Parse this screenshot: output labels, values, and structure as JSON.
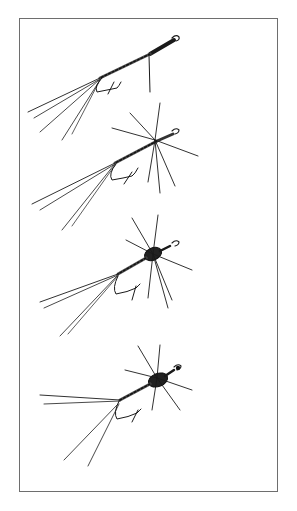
{
  "illustration": {
    "subject": "Four fly-fishing flies, pen-and-ink line drawings",
    "frame_color": "#6e6e6e",
    "ink_color": "#1a1a1a",
    "flies": [
      {
        "name": "fly-1",
        "style": "spinner with sparse hackle, long split tails"
      },
      {
        "name": "fly-2",
        "style": "spider-hackled dry fly, long split tails"
      },
      {
        "name": "fly-3",
        "style": "hackled fly with dark thorax"
      },
      {
        "name": "fly-4",
        "style": "hackled fly with dark thorax, spread tails"
      }
    ]
  },
  "caption": {
    "text": ""
  }
}
